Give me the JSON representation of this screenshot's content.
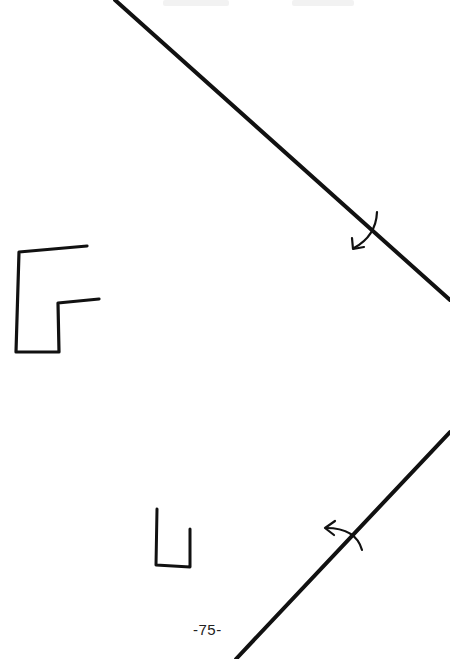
{
  "document": {
    "type": "hand-drawn folding diagram page",
    "page_number": "-75-",
    "figures": [
      {
        "name": "upper-diagonal-fold-line",
        "from": [
          115,
          0
        ],
        "to": [
          450,
          300
        ],
        "has_fold_arrow": true
      },
      {
        "name": "lower-diagonal-fold-line",
        "from": [
          236,
          659
        ],
        "to": [
          450,
          432
        ],
        "has_fold_arrow": true
      },
      {
        "name": "large-bracket-shape",
        "description": "F-like open rectangle outline"
      },
      {
        "name": "small-u-shape",
        "description": "small U-shaped outline"
      }
    ],
    "colors": {
      "ink": "#111111",
      "paper": "#ffffff"
    }
  }
}
